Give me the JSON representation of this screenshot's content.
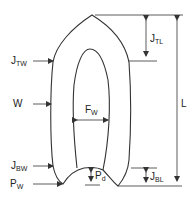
{
  "diagram": {
    "type": "dimensioned shape drawing",
    "line_color": "#333333",
    "labels": {
      "jtw": {
        "main": "J",
        "sub": "TW"
      },
      "w": {
        "main": "W",
        "sub": ""
      },
      "jbw": {
        "main": "J",
        "sub": "BW"
      },
      "pw": {
        "main": "P",
        "sub": "W"
      },
      "fw": {
        "main": "F",
        "sub": "W"
      },
      "pd": {
        "main": "P",
        "sub": "d"
      },
      "jtl": {
        "main": "J",
        "sub": "TL"
      },
      "jbl": {
        "main": "J",
        "sub": "BL"
      },
      "l": {
        "main": "L",
        "sub": ""
      }
    }
  }
}
